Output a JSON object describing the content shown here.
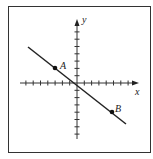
{
  "diagram": {
    "type": "coordinate-plane",
    "axes": {
      "x_label": "x",
      "y_label": "y",
      "x_ticks_negative": 8,
      "x_ticks_positive": 8,
      "y_ticks_positive": 8,
      "y_ticks_negative": 8
    },
    "line": {
      "description": "line with negative slope through origin",
      "slope_approx": -0.78
    },
    "points": [
      {
        "label": "A",
        "x_approx": -3,
        "y_approx": 2
      },
      {
        "label": "B",
        "x_approx": 5,
        "y_approx": -4
      }
    ]
  }
}
